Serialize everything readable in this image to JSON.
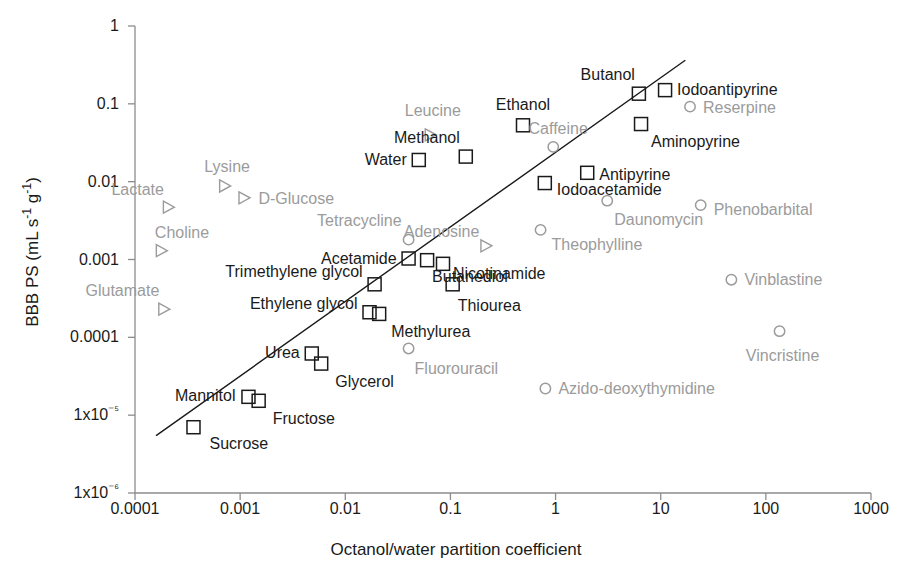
{
  "chart_data": {
    "type": "scatter",
    "title": "",
    "xlabel": "Octanol/water partition coefficient",
    "ylabel": "BBB PS (mL s⁻¹ g⁻¹)",
    "xscale": "log",
    "yscale": "log",
    "xlim": [
      0.0001,
      1000
    ],
    "ylim": [
      1e-06,
      1
    ],
    "grid": false,
    "legend": "none",
    "xticks": [
      "0.0001",
      "0.001",
      "0.01",
      "0.1",
      "1",
      "10",
      "100",
      "1000"
    ],
    "xtick_values": [
      0.0001,
      0.001,
      0.01,
      0.1,
      1,
      10,
      100,
      1000
    ],
    "yticks": [
      "1",
      "0.1",
      "0.01",
      "0.001",
      "0.0001",
      "1x10⁻⁵",
      "1x10⁻⁶"
    ],
    "ytick_values": [
      1,
      0.1,
      0.01,
      0.001,
      0.0001,
      1e-05,
      1e-06
    ],
    "marker_styles": {
      "square": {
        "shape": "square",
        "stroke": "#1a1a1a",
        "fill": "none",
        "label_color": "#1a1a1a"
      },
      "circle": {
        "shape": "circle",
        "stroke": "#9b9b9b",
        "fill": "none",
        "label_color": "#9b9b9b"
      },
      "triangle": {
        "shape": "triangle-right",
        "stroke": "#9b9b9b",
        "fill": "none",
        "label_color": "#9b9b9b"
      }
    },
    "trendline": {
      "x": [
        0.00016,
        17.0
      ],
      "y": [
        5.5e-06,
        0.36
      ],
      "color": "#1a1a1a",
      "width": 1.4
    },
    "points": [
      {
        "name": "Sucrose",
        "x": 0.00036,
        "y": 7e-06,
        "marker": "square",
        "label_pos": "right",
        "dx": 16,
        "dy": 17
      },
      {
        "name": "Mannitol",
        "x": 0.0012,
        "y": 1.72e-05,
        "marker": "square",
        "label_pos": "left",
        "dx": -13,
        "dy": -1
      },
      {
        "name": "Fructose",
        "x": 0.0015,
        "y": 1.53e-05,
        "marker": "square",
        "label_pos": "right",
        "dx": 14,
        "dy": 18
      },
      {
        "name": "Urea",
        "x": 0.0048,
        "y": 6.2e-05,
        "marker": "square",
        "label_pos": "left",
        "dx": -12,
        "dy": 0
      },
      {
        "name": "Glycerol",
        "x": 0.0059,
        "y": 4.6e-05,
        "marker": "square",
        "label_pos": "right",
        "dx": 14,
        "dy": 18
      },
      {
        "name": "Ethylene glycol",
        "x": 0.017,
        "y": 0.00021,
        "marker": "square",
        "label_pos": "left",
        "dx": -12,
        "dy": -8
      },
      {
        "name": "Methylurea",
        "x": 0.021,
        "y": 0.0002,
        "marker": "square",
        "label_pos": "right",
        "dx": 12,
        "dy": 18
      },
      {
        "name": "Trimethylene glycol",
        "x": 0.019,
        "y": 0.00048,
        "marker": "square",
        "label_pos": "left",
        "dx": -12,
        "dy": -12
      },
      {
        "name": "Acetamide",
        "x": 0.04,
        "y": 0.00103,
        "marker": "square",
        "label_pos": "left",
        "dx": -12,
        "dy": 0
      },
      {
        "name": "Butanediol",
        "x": 0.06,
        "y": 0.00098,
        "marker": "square",
        "label_pos": "right",
        "dx": 5,
        "dy": 17
      },
      {
        "name": "Nicotinamide",
        "x": 0.085,
        "y": 0.00088,
        "marker": "square",
        "label_pos": "right",
        "dx": 10,
        "dy": 10
      },
      {
        "name": "Thiourea",
        "x": 0.105,
        "y": 0.00048,
        "marker": "square",
        "label_pos": "right",
        "dx": 5,
        "dy": 22
      },
      {
        "name": "Water",
        "x": 0.05,
        "y": 0.019,
        "marker": "square",
        "label_pos": "left",
        "dx": -12,
        "dy": 0
      },
      {
        "name": "Methanol",
        "x": 0.14,
        "y": 0.021,
        "marker": "square",
        "label_pos": "left",
        "dx": -6,
        "dy": -19
      },
      {
        "name": "Ethanol",
        "x": 0.49,
        "y": 0.053,
        "marker": "square",
        "label_pos": "center",
        "dx": 0,
        "dy": -20
      },
      {
        "name": "Iodoacetamide",
        "x": 0.79,
        "y": 0.0096,
        "marker": "square",
        "label_pos": "right",
        "dx": 12,
        "dy": 7
      },
      {
        "name": "Antipyrine",
        "x": 2.0,
        "y": 0.013,
        "marker": "square",
        "label_pos": "right",
        "dx": 12,
        "dy": 2
      },
      {
        "name": "Butanol",
        "x": 6.2,
        "y": 0.135,
        "marker": "square",
        "label_pos": "left",
        "dx": -4,
        "dy": -19
      },
      {
        "name": "Aminopyrine",
        "x": 6.5,
        "y": 0.055,
        "marker": "square",
        "label_pos": "right",
        "dx": 10,
        "dy": 18
      },
      {
        "name": "Iodoantipyrine",
        "x": 11.0,
        "y": 0.15,
        "marker": "square",
        "label_pos": "right",
        "dx": 12,
        "dy": 0
      },
      {
        "name": "Lysine",
        "x": 0.00072,
        "y": 0.0088,
        "marker": "triangle",
        "label_pos": "center",
        "dx": 2,
        "dy": -19
      },
      {
        "name": "D-Glucose",
        "x": 0.0011,
        "y": 0.0062,
        "marker": "triangle",
        "label_pos": "right",
        "dx": 14,
        "dy": 1
      },
      {
        "name": "Lactate",
        "x": 0.00021,
        "y": 0.0047,
        "marker": "triangle",
        "label_pos": "left",
        "dx": -5,
        "dy": -17
      },
      {
        "name": "Choline",
        "x": 0.00018,
        "y": 0.0013,
        "marker": "triangle",
        "label_pos": "right",
        "dx": -7,
        "dy": -18
      },
      {
        "name": "Glutamate",
        "x": 0.00019,
        "y": 0.00023,
        "marker": "triangle",
        "label_pos": "left",
        "dx": -5,
        "dy": -18
      },
      {
        "name": "Leucine",
        "x": 0.065,
        "y": 0.04,
        "marker": "triangle",
        "label_pos": "center",
        "dx": 2,
        "dy": -24
      },
      {
        "name": "Adenosine",
        "x": 0.22,
        "y": 0.0015,
        "marker": "triangle",
        "label_pos": "left",
        "dx": -7,
        "dy": -14
      },
      {
        "name": "Tetracycline",
        "x": 0.04,
        "y": 0.0018,
        "marker": "circle",
        "label_pos": "left",
        "dx": -7,
        "dy": -19
      },
      {
        "name": "Caffeine",
        "x": 0.95,
        "y": 0.028,
        "marker": "circle",
        "label_pos": "center",
        "dx": 5,
        "dy": -18
      },
      {
        "name": "Theophylline",
        "x": 0.72,
        "y": 0.0024,
        "marker": "circle",
        "label_pos": "right",
        "dx": 11,
        "dy": 15
      },
      {
        "name": "Daunomycin",
        "x": 3.1,
        "y": 0.0057,
        "marker": "circle",
        "label_pos": "right",
        "dx": 7,
        "dy": 19
      },
      {
        "name": "Reserpine",
        "x": 19.0,
        "y": 0.092,
        "marker": "circle",
        "label_pos": "right",
        "dx": 13,
        "dy": 1
      },
      {
        "name": "Phenobarbital",
        "x": 24.0,
        "y": 0.005,
        "marker": "circle",
        "label_pos": "right",
        "dx": 13,
        "dy": 5
      },
      {
        "name": "Vinblastine",
        "x": 47.0,
        "y": 0.00055,
        "marker": "circle",
        "label_pos": "right",
        "dx": 13,
        "dy": 0
      },
      {
        "name": "Vincristine",
        "x": 135.0,
        "y": 0.00012,
        "marker": "circle",
        "label_pos": "center",
        "dx": 3,
        "dy": 25
      },
      {
        "name": "Fluorouracil",
        "x": 0.04,
        "y": 7.2e-05,
        "marker": "circle",
        "label_pos": "right",
        "dx": 6,
        "dy": 21
      },
      {
        "name": "Azido-deoxythymidine",
        "x": 0.8,
        "y": 2.2e-05,
        "marker": "circle",
        "label_pos": "right",
        "dx": 13,
        "dy": 0
      }
    ]
  },
  "axes": {
    "x_title": "Octanol/water partition coefficient",
    "y_title_text": "BBB PS  (mL s",
    "y_title_sup1": "-1",
    "y_title_mid": " g",
    "y_title_sup2": "-1",
    "y_title_end": ")"
  },
  "colors": {
    "axis": "#8c8c8c",
    "text_dark": "#1a1a1a",
    "text_gray": "#9b9b9b",
    "line": "#1a1a1a",
    "background": "#ffffff"
  }
}
